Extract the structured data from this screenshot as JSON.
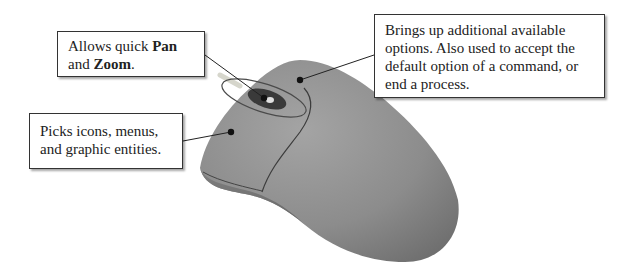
{
  "diagram": {
    "callouts": {
      "wheel": {
        "text_before": "Allows quick ",
        "bold_1": "Pan",
        "text_middle": "and ",
        "bold_2": "Zoom",
        "text_after": "."
      },
      "right_button": {
        "lines": [
          "Brings up additional available",
          "options. Also used to accept the",
          "default option of a command, or",
          "end a process."
        ]
      },
      "left_button": {
        "lines": [
          "Picks icons, menus,",
          "and graphic entities."
        ]
      }
    },
    "colors": {
      "mouse_body": "#8e8e8e",
      "mouse_shade": "#6f6f6f",
      "wheel": "#3a3a3a",
      "border": "#333333"
    }
  }
}
